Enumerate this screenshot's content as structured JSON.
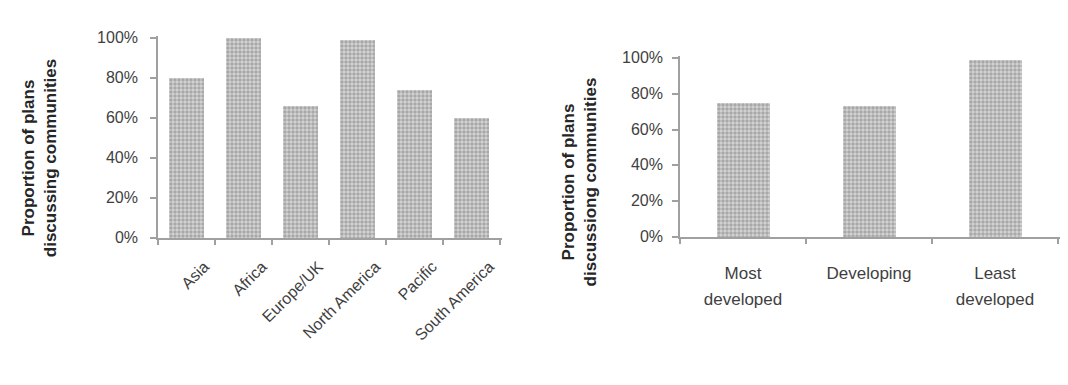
{
  "figure": {
    "background": "#ffffff",
    "bar_color": "#b9b9b9",
    "axis_color": "#a0a0a0",
    "tick_text_color": "#3f3f3f",
    "axis_title_color": "#262626"
  },
  "chart_data": [
    {
      "type": "bar",
      "title": "",
      "ylabel": "Proportion of plans discussing communities",
      "ylabel_lines": [
        "Proportion of plans",
        "discussing communities"
      ],
      "xlabel": "",
      "categories": [
        "Asia",
        "Africa",
        "Europe/UK",
        "North America",
        "Pacific",
        "South America"
      ],
      "values": [
        80,
        100,
        66,
        99,
        74,
        60
      ],
      "yticks": [
        "0%",
        "20%",
        "40%",
        "60%",
        "80%",
        "100%"
      ],
      "ylim": [
        0,
        100
      ],
      "grid": false,
      "legend": null,
      "xtick_rotation": 45,
      "xtick_wrap": false
    },
    {
      "type": "bar",
      "title": "",
      "ylabel": "Proportion of plans discussiong communities",
      "ylabel_lines": [
        "Proportion of plans",
        "discussiong communities"
      ],
      "xlabel": "",
      "categories": [
        "Most developed",
        "Developing",
        "Least developed"
      ],
      "values": [
        75,
        73,
        99
      ],
      "yticks": [
        "0%",
        "20%",
        "40%",
        "60%",
        "80%",
        "100%"
      ],
      "ylim": [
        0,
        100
      ],
      "grid": false,
      "legend": null,
      "xtick_rotation": 0,
      "xtick_wrap": true
    }
  ]
}
